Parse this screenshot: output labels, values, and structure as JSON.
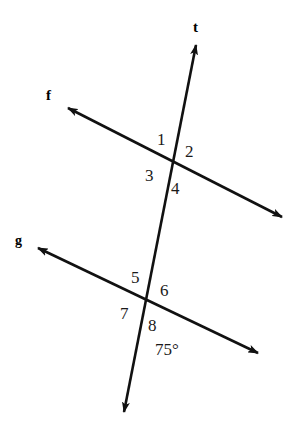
{
  "diagram": {
    "type": "geometry-transversal",
    "background_color": "#ffffff",
    "stroke_color": "#111111",
    "lines": [
      {
        "id": "t",
        "label": "t",
        "role": "transversal",
        "label_position": {
          "x": 193,
          "y": 20
        },
        "start": {
          "x": 196,
          "y": 45
        },
        "end": {
          "x": 124,
          "y": 412
        },
        "arrow_start": true,
        "arrow_end": true
      },
      {
        "id": "f",
        "label": "f",
        "role": "parallel-line-upper",
        "label_position": {
          "x": 46,
          "y": 88
        },
        "start": {
          "x": 68,
          "y": 108
        },
        "end": {
          "x": 282,
          "y": 217
        },
        "arrow_start": true,
        "arrow_end": true
      },
      {
        "id": "g",
        "label": "g",
        "role": "parallel-line-lower",
        "label_position": {
          "x": 15,
          "y": 234
        },
        "start": {
          "x": 38,
          "y": 248
        },
        "end": {
          "x": 258,
          "y": 353
        },
        "arrow_start": true,
        "arrow_end": true
      }
    ],
    "intersections": [
      {
        "id": "upper",
        "lines": [
          "t",
          "f"
        ],
        "x": 172,
        "y": 162
      },
      {
        "id": "lower",
        "lines": [
          "t",
          "g"
        ],
        "x": 147,
        "y": 300
      }
    ],
    "angle_labels": [
      {
        "id": "angle-1",
        "text": "1",
        "x": 157,
        "y": 131
      },
      {
        "id": "angle-2",
        "text": "2",
        "x": 185,
        "y": 143
      },
      {
        "id": "angle-3",
        "text": "3",
        "x": 145,
        "y": 167
      },
      {
        "id": "angle-4",
        "text": "4",
        "x": 171,
        "y": 180
      },
      {
        "id": "angle-5",
        "text": "5",
        "x": 131,
        "y": 269
      },
      {
        "id": "angle-6",
        "text": "6",
        "x": 160,
        "y": 282
      },
      {
        "id": "angle-7",
        "text": "7",
        "x": 120,
        "y": 305
      },
      {
        "id": "angle-8",
        "text": "8",
        "x": 148,
        "y": 317
      }
    ],
    "angle_measures": [
      {
        "id": "measure-75",
        "text": "75°",
        "x": 155,
        "y": 341
      }
    ]
  }
}
